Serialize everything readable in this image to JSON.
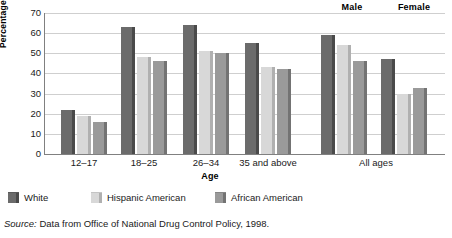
{
  "chart_data": {
    "type": "bar",
    "title": "",
    "xlabel": "Age",
    "ylabel": "Percentage",
    "ylim": [
      0,
      70
    ],
    "yticks": [
      0,
      10,
      20,
      30,
      40,
      50,
      60,
      70
    ],
    "grid": true,
    "legend_position": "below-plot",
    "categories": [
      "12–17",
      "18–25",
      "26–34",
      "35 and above",
      "All ages",
      "All ages"
    ],
    "group_headers": [
      {
        "label": "Male",
        "applies_to_category_index": 4
      },
      {
        "label": "Female",
        "applies_to_category_index": 5
      }
    ],
    "series": [
      {
        "name": "White",
        "color": "#6b6b6b",
        "values": [
          22,
          63,
          64,
          55,
          59,
          47
        ]
      },
      {
        "name": "Hispanic American",
        "color": "#d8d8d8",
        "values": [
          19,
          48,
          51,
          43,
          54,
          30
        ]
      },
      {
        "name": "African American",
        "color": "#9a9a9a",
        "values": [
          16,
          46,
          50,
          42,
          46,
          33
        ]
      }
    ]
  },
  "axes": {
    "y_label": "Percentage",
    "x_label": "Age",
    "y_ticks": [
      "0",
      "10",
      "20",
      "30",
      "40",
      "50",
      "60",
      "70"
    ],
    "x_ticks": [
      "12–17",
      "18–25",
      "26–34",
      "35 and above",
      "All ages"
    ]
  },
  "headers": {
    "male": "Male",
    "female": "Female"
  },
  "legend": {
    "items": [
      {
        "label": "White",
        "color": "#6b6b6b"
      },
      {
        "label": "Hispanic American",
        "color": "#d8d8d8"
      },
      {
        "label": "African American",
        "color": "#9a9a9a"
      }
    ]
  },
  "source": {
    "prefix": "Source:",
    "text": " Data from Office of National Drug Control Policy, 1998."
  }
}
